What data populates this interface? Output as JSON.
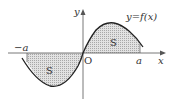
{
  "diagram": {
    "curve_label": "y=f(x)",
    "x_axis_label": "x",
    "y_axis_label": "y",
    "origin_label": "O",
    "left_bound_label": "−a",
    "right_bound_label": "a",
    "region_labels": [
      "S",
      "S"
    ],
    "colors": {
      "axis": "#555555",
      "curve": "#222222",
      "shade": "#d0d0d0",
      "text": "#333333"
    }
  }
}
